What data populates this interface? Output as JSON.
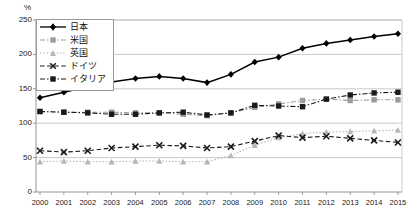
{
  "chart_data": {
    "type": "line",
    "title": "",
    "subtitle": "",
    "unit_label": "%",
    "xlabel": "",
    "ylabel": "",
    "grid": true,
    "legend_position": "top-left",
    "ylim": [
      0,
      250
    ],
    "yticks": [
      0,
      50,
      100,
      150,
      200,
      250
    ],
    "ytick_labels": [
      "0",
      "50",
      "100",
      "150",
      "200",
      "250"
    ],
    "categories": [
      2000,
      2001,
      2002,
      2003,
      2004,
      2005,
      2006,
      2007,
      2008,
      2009,
      2010,
      2011,
      2012,
      2013,
      2014,
      2015
    ],
    "xtick_labels": [
      "2000",
      "2001",
      "2002",
      "2003",
      "2004",
      "2005",
      "2006",
      "2007",
      "2008",
      "2009",
      "2010",
      "2011",
      "2012",
      "2013",
      "2014",
      "2015"
    ],
    "series": [
      {
        "name": "日本",
        "color": "#000000",
        "marker": "diamond",
        "dash": "solid",
        "values": [
          137,
          145,
          153,
          160,
          165,
          168,
          165,
          159,
          171,
          189,
          196,
          209,
          216,
          221,
          226,
          230
        ]
      },
      {
        "name": "米国",
        "color": "#9c9c9c",
        "marker": "square",
        "dash": "dash-dot",
        "values": [
          117,
          116,
          116,
          116,
          115,
          115,
          113,
          111,
          115,
          123,
          128,
          133,
          135,
          133,
          134,
          134
        ]
      },
      {
        "name": "英国",
        "color": "#b6b6b6",
        "marker": "triangle",
        "dash": "dotted",
        "values": [
          44,
          45,
          44,
          44,
          45,
          45,
          44,
          44,
          53,
          68,
          79,
          85,
          87,
          88,
          89,
          90
        ]
      },
      {
        "name": "ドイツ",
        "color": "#1a1a1a",
        "marker": "x",
        "dash": "dashed",
        "values": [
          60,
          58,
          60,
          64,
          66,
          68,
          67,
          64,
          66,
          74,
          82,
          79,
          81,
          78,
          75,
          72
        ]
      },
      {
        "name": "イタリア",
        "color": "#1a1a1a",
        "marker": "square",
        "dash": "dash-dot",
        "values": [
          117,
          116,
          115,
          113,
          113,
          115,
          116,
          112,
          115,
          126,
          125,
          124,
          135,
          141,
          144,
          145
        ]
      }
    ]
  },
  "legend": {
    "items": [
      {
        "label": "日本"
      },
      {
        "label": "米国"
      },
      {
        "label": "英国"
      },
      {
        "label": "ドイツ"
      },
      {
        "label": "イタリア"
      }
    ]
  }
}
